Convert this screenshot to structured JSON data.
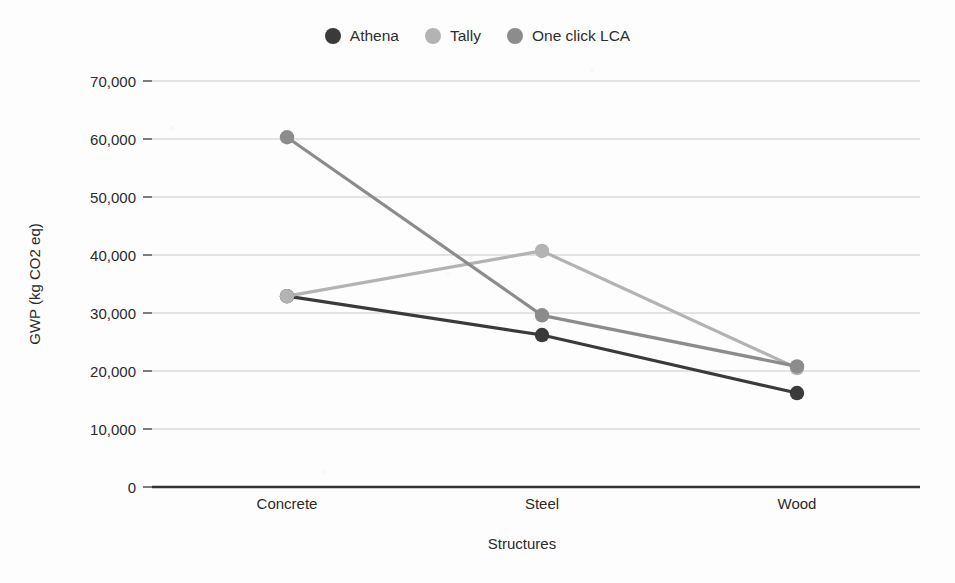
{
  "chart_data": {
    "type": "line",
    "title": "",
    "xlabel": "Structures",
    "ylabel": "GWP (kg CO2 eq)",
    "categories": [
      "Concrete",
      "Steel",
      "Wood"
    ],
    "ylim": [
      0,
      70000
    ],
    "ytick_labels": [
      "70,000",
      "60,000",
      "50,000",
      "40,000",
      "30,000",
      "20,000",
      "10,000",
      "0"
    ],
    "ytick_values": [
      70000,
      60000,
      50000,
      40000,
      30000,
      20000,
      10000,
      0
    ],
    "grid": true,
    "legend_position": "top-center",
    "series": [
      {
        "name": "Athena",
        "color": "#3a3a3a",
        "values": [
          32900,
          26200,
          16200
        ]
      },
      {
        "name": "Tally",
        "color": "#b3b3b3",
        "values": [
          32900,
          40700,
          20500
        ]
      },
      {
        "name": "One click LCA",
        "color": "#8c8c8c",
        "values": [
          60300,
          29600,
          20800
        ]
      }
    ]
  },
  "legend": {
    "items": [
      {
        "label": "Athena",
        "swatch": "legend-dot-athena"
      },
      {
        "label": "Tally",
        "swatch": "legend-dot-tally"
      },
      {
        "label": "One click LCA",
        "swatch": "legend-dot-one-click-lca"
      }
    ]
  },
  "axes": {
    "y_title": "GWP (kg CO2 eq)",
    "x_title": "Structures",
    "y_ticks": [
      "70,000",
      "60,000",
      "50,000",
      "40,000",
      "30,000",
      "20,000",
      "10,000",
      "0"
    ],
    "x_ticks": [
      "Concrete",
      "Steel",
      "Wood"
    ]
  }
}
